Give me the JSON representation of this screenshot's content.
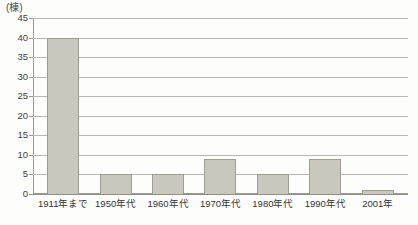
{
  "chart_data": {
    "type": "bar",
    "title": "",
    "subtitle": "",
    "xlabel": "",
    "ylabel": "(棟)",
    "unit_label": "(棟)",
    "categories": [
      "1911年まで",
      "1950年代",
      "1960年代",
      "1970年代",
      "1980年代",
      "1990年代",
      "2001年"
    ],
    "values": [
      40,
      5,
      5,
      9,
      5,
      9,
      1
    ],
    "ylim": [
      0,
      45
    ],
    "ytick_values": [
      0,
      5,
      10,
      15,
      20,
      25,
      30,
      35,
      40,
      45
    ],
    "ytick_labels": [
      "0",
      "5",
      "10",
      "15",
      "20",
      "25",
      "30",
      "35",
      "40",
      "45"
    ],
    "grid": true,
    "legend": false,
    "legend_position": "none",
    "bar_fill_color": "#c8c8bf",
    "bar_border_color": "#9d9d94",
    "gridline_color": "#b9b9b2",
    "axis_color": "#9a9a93",
    "background_color": "#fdfdfc",
    "text_color": "#343434"
  }
}
